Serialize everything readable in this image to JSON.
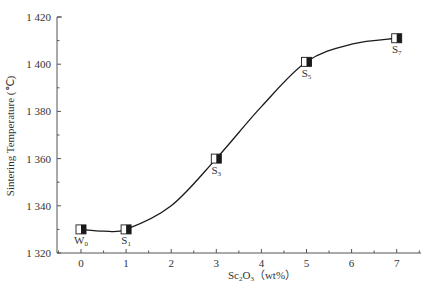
{
  "chart_data": {
    "type": "line",
    "title": "",
    "xlabel": "Sc2O3 (wt%)",
    "xlabel_parts": {
      "base": "Sc",
      "sub1": "2",
      "mid": "O",
      "sub2": "3",
      "unit": "（wt%）"
    },
    "ylabel": "Sintering Temperature (℃)",
    "xlim": [
      -0.5,
      7.5
    ],
    "ylim": [
      1320,
      1420
    ],
    "x_ticks": [
      "0",
      "1",
      "2",
      "3",
      "4",
      "5",
      "6",
      "7"
    ],
    "y_ticks": [
      "1 320",
      "1 340",
      "1 360",
      "1 380",
      "1 400",
      "1 420"
    ],
    "grid": false,
    "legend": null,
    "series": [
      {
        "name": "Sintering Temperature",
        "x": [
          0,
          1,
          3,
          5,
          7
        ],
        "values": [
          1330,
          1330,
          1360,
          1401,
          1411
        ],
        "point_labels": [
          {
            "base": "W",
            "sub": "0"
          },
          {
            "base": "S",
            "sub": "1"
          },
          {
            "base": "S",
            "sub": "3"
          },
          {
            "base": "S",
            "sub": "5"
          },
          {
            "base": "S",
            "sub": "7"
          }
        ],
        "marker": "half-filled-square",
        "smooth": true
      }
    ],
    "colors": {
      "line": "#1a1a1a",
      "axis": "#555555",
      "text": "#333333"
    }
  }
}
